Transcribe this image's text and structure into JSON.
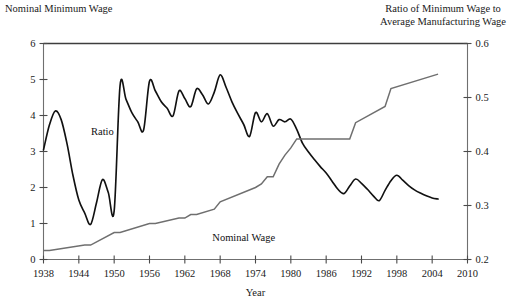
{
  "titles": {
    "left_axis_title": "Nominal Minimum Wage",
    "right_axis_title_line1": "Ratio of Minimum Wage to",
    "right_axis_title_line2": "Average Manufacturing Wage"
  },
  "labels": {
    "ratio_series": "Ratio",
    "wage_series": "Nominal Wage",
    "x_axis_title": "Year"
  },
  "chart_data": {
    "type": "line",
    "title": "",
    "subtitle": "",
    "xlabel": "Year",
    "ylabel": "Nominal Minimum Wage",
    "y2label": "Ratio of Minimum Wage to Average Manufacturing Wage",
    "grid": false,
    "legend": "inline-annotations",
    "xlim": [
      1938,
      2010
    ],
    "xticks": [
      1938,
      1944,
      1950,
      1956,
      1962,
      1968,
      1974,
      1980,
      1986,
      1992,
      1998,
      2004,
      2010
    ],
    "xtick_labels": [
      "1938",
      "1944",
      "1950",
      "1956",
      "1962",
      "1968",
      "1974",
      "1980",
      "1986",
      "1992",
      "1998",
      "2004",
      "2010"
    ],
    "ylim": [
      0,
      6
    ],
    "yticks": [
      0,
      1,
      2,
      3,
      4,
      5,
      6
    ],
    "ytick_labels": [
      "0",
      "1",
      "2",
      "3",
      "4",
      "5",
      "6"
    ],
    "y2lim": [
      0.2,
      0.6
    ],
    "y2ticks": [
      0.2,
      0.3,
      0.4,
      0.5,
      0.6
    ],
    "y2tick_labels": [
      "0.2",
      "0.3",
      "0.4",
      "0.5",
      "0.6"
    ],
    "series": [
      {
        "name": "Ratio",
        "axis": "right",
        "color": "#111111",
        "x": [
          1938,
          1939,
          1940,
          1941,
          1942,
          1943,
          1944,
          1945,
          1946,
          1947,
          1948,
          1949,
          1950,
          1951,
          1952,
          1953,
          1954,
          1955,
          1956,
          1957,
          1958,
          1959,
          1960,
          1961,
          1962,
          1963,
          1964,
          1965,
          1966,
          1967,
          1968,
          1969,
          1970,
          1971,
          1972,
          1973,
          1974,
          1975,
          1976,
          1977,
          1978,
          1979,
          1980,
          1981,
          1982,
          1983,
          1984,
          1985,
          1986,
          1987,
          1988,
          1989,
          1990,
          1991,
          1992,
          1993,
          1994,
          1995,
          1996,
          1997,
          1998,
          1999,
          2000,
          2001,
          2002,
          2003,
          2004,
          2005
        ],
        "values": [
          0.403,
          0.449,
          0.475,
          0.459,
          0.414,
          0.356,
          0.31,
          0.286,
          0.265,
          0.305,
          0.348,
          0.324,
          0.29,
          0.522,
          0.497,
          0.472,
          0.455,
          0.44,
          0.53,
          0.512,
          0.492,
          0.48,
          0.466,
          0.512,
          0.498,
          0.483,
          0.516,
          0.505,
          0.488,
          0.51,
          0.542,
          0.519,
          0.492,
          0.47,
          0.45,
          0.428,
          0.472,
          0.455,
          0.47,
          0.447,
          0.459,
          0.455,
          0.46,
          0.441,
          0.415,
          0.399,
          0.385,
          0.372,
          0.36,
          0.345,
          0.33,
          0.322,
          0.336,
          0.349,
          0.341,
          0.33,
          0.318,
          0.309,
          0.328,
          0.346,
          0.356,
          0.347,
          0.337,
          0.329,
          0.323,
          0.318,
          0.314,
          0.312
        ]
      },
      {
        "name": "Nominal Wage",
        "axis": "left",
        "color": "#6f6f6f",
        "x": [
          1938,
          1939,
          1945,
          1946,
          1950,
          1951,
          1956,
          1957,
          1961,
          1962,
          1963,
          1964,
          1967,
          1968,
          1974,
          1975,
          1976,
          1977,
          1978,
          1979,
          1980,
          1981,
          1990,
          1991,
          1996,
          1997,
          2005
        ],
        "values": [
          0.25,
          0.25,
          0.4,
          0.4,
          0.75,
          0.75,
          1.0,
          1.0,
          1.15,
          1.15,
          1.25,
          1.25,
          1.4,
          1.6,
          2.0,
          2.1,
          2.3,
          2.3,
          2.65,
          2.9,
          3.1,
          3.35,
          3.35,
          3.8,
          4.25,
          4.75,
          5.15
        ]
      }
    ],
    "annotations": [
      {
        "text": "Ratio",
        "x": 1948,
        "y_left": 3.55
      },
      {
        "text": "Nominal Wage",
        "x": 1972,
        "y_left": 0.62
      }
    ]
  }
}
